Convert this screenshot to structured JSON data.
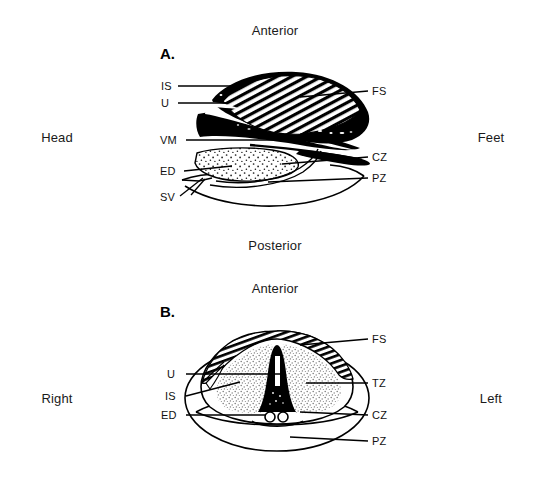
{
  "figure": {
    "panels": [
      {
        "id": "A",
        "letter": "A.",
        "view": "sagittal-longitudinal",
        "top_orientation": "Anterior",
        "bottom_orientation": "Posterior",
        "left_orientation": "Head",
        "right_orientation": "Feet",
        "left_labels": [
          {
            "key": "IS",
            "text": "IS"
          },
          {
            "key": "U",
            "text": "U"
          },
          {
            "key": "VM",
            "text": "VM"
          },
          {
            "key": "ED",
            "text": "ED"
          },
          {
            "key": "SV",
            "text": "SV"
          }
        ],
        "right_labels": [
          {
            "key": "FS",
            "text": "FS"
          },
          {
            "key": "CZ",
            "text": "CZ"
          },
          {
            "key": "PZ",
            "text": "PZ"
          }
        ]
      },
      {
        "id": "B",
        "letter": "B.",
        "view": "transverse-cross-section",
        "top_orientation": "Anterior",
        "left_orientation": "Right",
        "right_orientation": "Left",
        "left_labels": [
          {
            "key": "U",
            "text": "U"
          },
          {
            "key": "IS",
            "text": "IS"
          },
          {
            "key": "ED",
            "text": "ED"
          }
        ],
        "right_labels": [
          {
            "key": "FS",
            "text": "FS"
          },
          {
            "key": "TZ",
            "text": "TZ"
          },
          {
            "key": "CZ",
            "text": "CZ"
          },
          {
            "key": "PZ",
            "text": "PZ"
          }
        ]
      }
    ],
    "orientation_labels": {
      "anterior_top": "Anterior",
      "posterior": "Posterior",
      "anterior_lower": "Anterior",
      "head": "Head",
      "feet": "Feet",
      "right": "Right",
      "left": "Left"
    },
    "colors": {
      "background": "#ffffff",
      "ink": "#000000",
      "stipple": "#9a9a9a",
      "text": "#111111"
    }
  }
}
